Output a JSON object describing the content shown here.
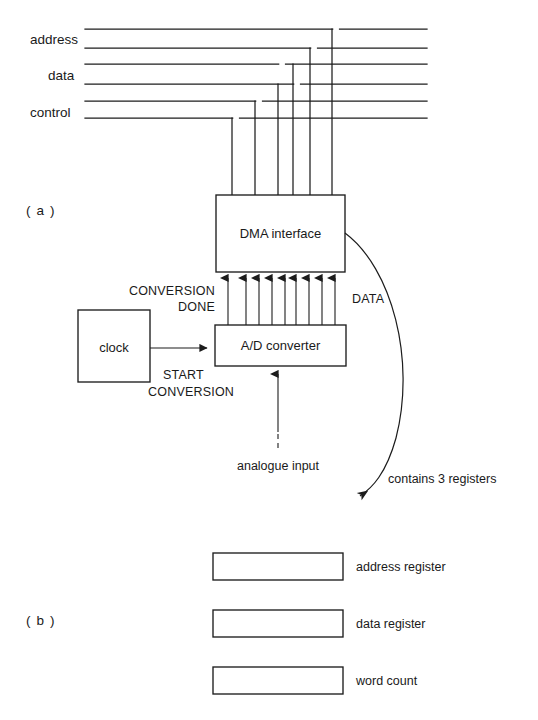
{
  "figure": {
    "panels": [
      {
        "id": "a",
        "label": "( a )"
      },
      {
        "id": "b",
        "label": "( b )"
      }
    ]
  },
  "bus": {
    "labels": [
      {
        "name": "address",
        "text": "address"
      },
      {
        "name": "data",
        "text": "data"
      },
      {
        "name": "control",
        "text": "control"
      }
    ],
    "line_count": 6,
    "drop_count": 6
  },
  "blocks": [
    {
      "name": "dma-interface",
      "label": "DMA   interface"
    },
    {
      "name": "ad-converter",
      "label": "A/D converter"
    },
    {
      "name": "clock",
      "label": "clock"
    }
  ],
  "signals": [
    {
      "name": "conversion-done",
      "line1": "CONVERSION",
      "line2": "DONE"
    },
    {
      "name": "start-conversion",
      "line1": "START",
      "line2": "CONVERSION"
    },
    {
      "name": "data-bus-label",
      "text": "DATA"
    },
    {
      "name": "analogue-input",
      "text": "analogue input"
    }
  ],
  "annotation": {
    "contains_registers": "contains 3 registers"
  },
  "registers": [
    {
      "name": "address-register",
      "label": "address register"
    },
    {
      "name": "data-register",
      "label": "data register"
    },
    {
      "name": "word-count",
      "label": "word count"
    }
  ],
  "colors": {
    "ink": "#1c1c1c",
    "paper": "#ffffff"
  }
}
